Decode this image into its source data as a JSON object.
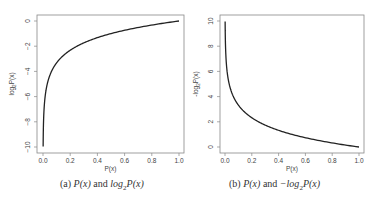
{
  "chart_data": [
    {
      "type": "line",
      "function": "log2(x)",
      "title": "",
      "xlabel": "P(x)",
      "ylabel": "log2P(x)",
      "xlim": [
        0.0,
        1.0
      ],
      "ylim": [
        -10,
        0
      ],
      "xticks": [
        "0.0",
        "0.2",
        "0.4",
        "0.6",
        "0.8",
        "1.0"
      ],
      "yticks": [
        "-10",
        "-8",
        "-6",
        "-4",
        "-2",
        "0"
      ],
      "grid": false,
      "x": [
        0.001,
        0.01,
        0.05,
        0.1,
        0.2,
        0.4,
        0.6,
        0.8,
        1.0
      ],
      "values": [
        -9.97,
        -6.64,
        -4.32,
        -3.32,
        -2.32,
        -1.32,
        -0.74,
        -0.32,
        0.0
      ],
      "caption": "(a) P(x) and log2P(x)"
    },
    {
      "type": "line",
      "function": "-log2(x)",
      "title": "",
      "xlabel": "P(x)",
      "ylabel": "-log2P(x)",
      "xlim": [
        0.0,
        1.0
      ],
      "ylim": [
        0,
        10
      ],
      "xticks": [
        "0.0",
        "0.2",
        "0.4",
        "0.6",
        "0.8",
        "1.0"
      ],
      "yticks": [
        "0",
        "2",
        "4",
        "6",
        "8",
        "10"
      ],
      "grid": false,
      "x": [
        0.001,
        0.01,
        0.05,
        0.1,
        0.2,
        0.4,
        0.6,
        0.8,
        1.0
      ],
      "values": [
        9.97,
        6.64,
        4.32,
        3.32,
        2.32,
        1.32,
        0.74,
        0.32,
        0.0
      ],
      "caption": "(b) P(x) and -log2P(x)"
    }
  ],
  "captions": {
    "a": {
      "prefix": "(a) ",
      "p1": "P(x)",
      "mid": " and ",
      "p2": "log",
      "sub": "2",
      "p3": "P(x)"
    },
    "b": {
      "prefix": "(b) ",
      "p1": "P(x)",
      "mid": " and ",
      "p2": "−log",
      "sub": "2",
      "p3": "P(x)"
    }
  },
  "colors": {
    "line": "#222222",
    "axis": "#888888",
    "text": "#444444"
  }
}
